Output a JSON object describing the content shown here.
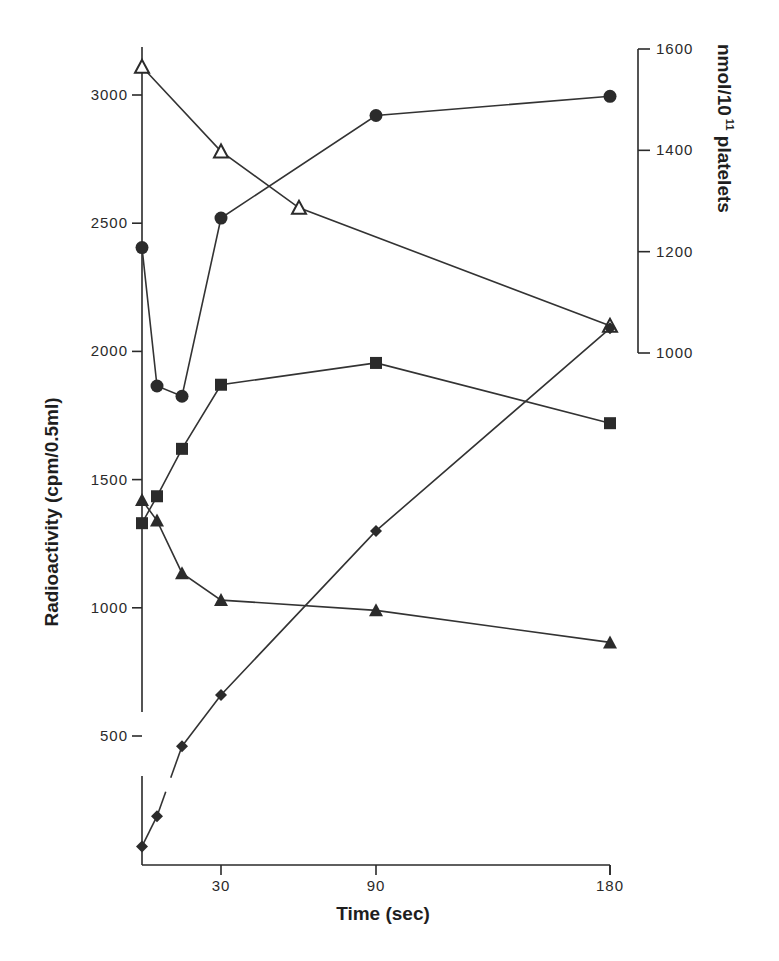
{
  "chart_data": {
    "type": "line",
    "title": "",
    "xlabel": "Time (sec)",
    "ylabel": "Radioactivity (cpm/0.5ml)",
    "y2label": "nmol/10^11 platelets",
    "y2label_parts": {
      "base": "nmol/10",
      "sup": "11",
      "tail": " platelets"
    },
    "x_ticks": [
      "30",
      "90",
      "180"
    ],
    "x_tick_values": [
      30,
      90,
      180
    ],
    "y_ticks": [
      "500",
      "1000",
      "1500",
      "2000",
      "2500",
      "3000"
    ],
    "y_tick_values": [
      500,
      1000,
      1500,
      2000,
      2500,
      3000
    ],
    "y2_ticks": [
      "1000",
      "1200",
      "1400",
      "1600"
    ],
    "y2_tick_values": [
      1000,
      1200,
      1400,
      1600
    ],
    "ylim": [
      0,
      3200
    ],
    "y2lim": [
      1000,
      1600
    ],
    "xlim": [
      0,
      180
    ],
    "x_scale_note": "non-linear (expanded early time points)",
    "y_axis_break": "between 0 and 500 on left axis",
    "grid": false,
    "legend": "none (series distinguished by marker)",
    "series": [
      {
        "name": "open-triangle",
        "marker": "open-triangle",
        "x": [
          0,
          30,
          60,
          180
        ],
        "values": [
          3110,
          2780,
          2560,
          2100
        ]
      },
      {
        "name": "filled-circle",
        "marker": "filled-circle",
        "x": [
          0,
          5,
          15,
          30,
          90,
          180
        ],
        "values": [
          2405,
          1865,
          1825,
          2520,
          2920,
          2995
        ]
      },
      {
        "name": "filled-square",
        "marker": "filled-square",
        "x": [
          0,
          5,
          15,
          30,
          90,
          180
        ],
        "values": [
          1330,
          1435,
          1620,
          1870,
          1955,
          1720
        ]
      },
      {
        "name": "filled-triangle",
        "marker": "filled-triangle",
        "x": [
          0,
          5,
          15,
          30,
          90,
          180
        ],
        "values": [
          1420,
          1340,
          1135,
          1030,
          990,
          865
        ]
      },
      {
        "name": "filled-diamond",
        "marker": "filled-diamond",
        "x": [
          0,
          5,
          15,
          30,
          90,
          180
        ],
        "values": [
          70,
          190,
          460,
          660,
          1300,
          2090
        ]
      }
    ]
  }
}
